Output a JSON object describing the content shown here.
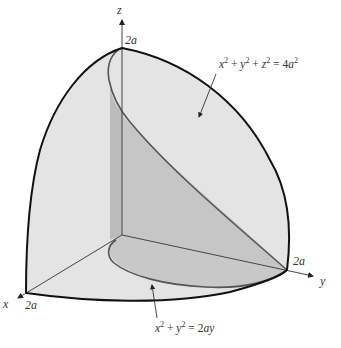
{
  "figure": {
    "type": "3d-solid-diagram",
    "axes": {
      "z": {
        "label": "z",
        "tick_label": "2a"
      },
      "y": {
        "label": "y",
        "tick_label": "2a"
      },
      "x": {
        "label": "x",
        "tick_label": "2a"
      }
    },
    "annotations": {
      "sphere": {
        "eq_left": "x",
        "eq_mid1": " + y",
        "eq_mid2": " + z",
        "eq_right": " = 4a",
        "sup": "2"
      },
      "cylinder": {
        "eq_left": "x",
        "eq_mid": " + y",
        "eq_right": " = 2ay",
        "sup": "2"
      }
    },
    "colors": {
      "sphere_fill": "#e4e4e4",
      "region_fill": "#c4c4c4",
      "strip_fill": "#b8b8b8",
      "outline": "#111111",
      "curve": "#555555"
    }
  }
}
